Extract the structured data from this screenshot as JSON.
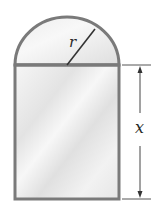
{
  "diagram": {
    "labels": {
      "radius": "r",
      "height": "x"
    },
    "colors": {
      "border": "#7a7a7a",
      "fill_light": "#f4f4f4",
      "fill_mid": "#e2e2e2",
      "dimension_line": "#444444",
      "text": "#2a2a2a"
    }
  }
}
